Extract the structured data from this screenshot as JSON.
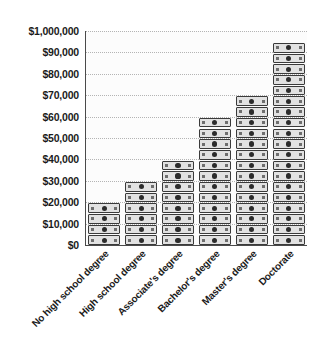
{
  "chart_data": {
    "type": "bar",
    "title": "",
    "subtitle": "",
    "xlabel": "",
    "ylabel": "",
    "categories": [
      "No high school degree",
      "High school degree",
      "Associate's degree",
      "Bachelor's degree",
      "Master's degree",
      "Doctorate"
    ],
    "values": [
      20000,
      27000,
      33000,
      52000,
      62000,
      92000
    ],
    "icon_counts": [
      4,
      6,
      8,
      12,
      14,
      19
    ],
    "value_per_icon": 5000,
    "ylim": [
      0,
      100000
    ],
    "ytick_labels": [
      "$0",
      "$10,000",
      "$20,000",
      "$30,000",
      "$40,000",
      "$50,000",
      "$60,000",
      "$70,000",
      "$80,000",
      "$90,000",
      "$1,000,000"
    ],
    "ytick_values": [
      0,
      10000,
      20000,
      30000,
      40000,
      50000,
      60000,
      70000,
      80000,
      90000,
      100000
    ],
    "grid": true,
    "grid_style": "dotted-horizontal",
    "legend": "none",
    "marker_icon": "banknote-icon",
    "colors": {
      "plot_background": "#fcfcfc",
      "axis_line": "#4a4a4a",
      "gridline": "#b4b4b4",
      "note_fill": "#e2e2e2",
      "note_border": "#3a3a3a",
      "text": "#1b1b1b",
      "page_background": "#ffffff"
    }
  }
}
